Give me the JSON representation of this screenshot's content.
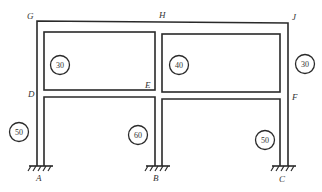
{
  "diagram": {
    "type": "multi-story rigid frame",
    "nodes": {
      "G": "G",
      "H": "H",
      "J": "J",
      "D": "D",
      "E": "E",
      "F": "F",
      "A": "A",
      "B": "B",
      "C": "C"
    },
    "member_values": {
      "upper_left_room": "30",
      "upper_right_room": "40",
      "right_upper_column": "30",
      "left_lower_column": "50",
      "middle_lower_column": "60",
      "right_lower_column": "50"
    },
    "supports": [
      "A",
      "B",
      "C"
    ],
    "colors": {
      "line": "#2a2a2a",
      "text": "#333333",
      "background": "#ffffff"
    }
  }
}
